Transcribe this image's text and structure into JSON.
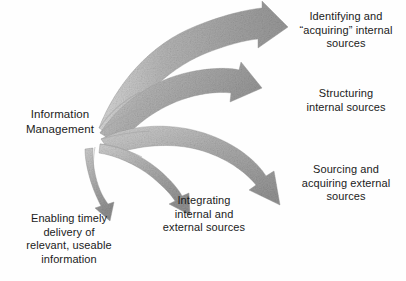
{
  "diagram": {
    "title": "Information Management",
    "source_node": {
      "label": "Information\nManagement"
    },
    "outcomes": [
      {
        "id": "identifying",
        "label": "Identifying and\n“acquiring” internal\nsources",
        "arrow": "curved-arrow-up-right"
      },
      {
        "id": "structuring",
        "label": "Structuring\ninternal sources",
        "arrow": "curved-arrow-right"
      },
      {
        "id": "sourcing",
        "label": "Sourcing and\nacquiring external\nsources",
        "arrow": "curved-arrow-down-right"
      },
      {
        "id": "integrating",
        "label": "Integrating\ninternal and\nexternal sources",
        "arrow": "curved-arrow-down"
      },
      {
        "id": "enabling",
        "label": "Enabling timely\ndelivery of\nrelevant, useable\ninformation",
        "arrow": "curved-arrow-down-left"
      }
    ],
    "colors": {
      "background": "#fefefe",
      "text": "#1b1b1b",
      "arrow_fill_light": "#c9c9c9",
      "arrow_fill_mid": "#a8a8a8",
      "arrow_fill_dark": "#8d8d8d"
    }
  }
}
